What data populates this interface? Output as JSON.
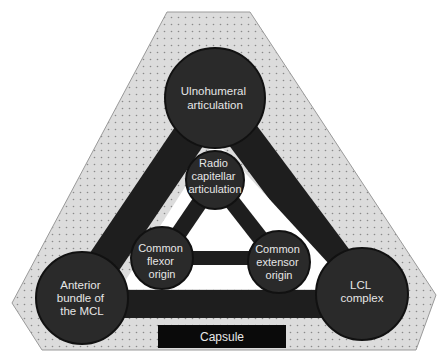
{
  "diagram": {
    "colors": {
      "background": "#ffffff",
      "capsule_fill": "#dcdcdc",
      "capsule_dot": "#8a8a8a",
      "capsule_border": "#9a9a9a",
      "band": "#1e1e1e",
      "node": "#2a2a2a",
      "node_border": "#111111",
      "label_text": "#e6e6e6",
      "capsule_box": "#0a0a0a"
    },
    "nodes": {
      "ulnohumeral": {
        "lines": [
          "Ulnohumeral",
          "articulation"
        ]
      },
      "radiocapitellar": {
        "lines": [
          "Radio",
          "capitellar",
          "articulation"
        ]
      },
      "common_flexor": {
        "lines": [
          "Common",
          "flexor",
          "origin"
        ]
      },
      "common_extensor": {
        "lines": [
          "Common",
          "extensor",
          "origin"
        ]
      },
      "anterior_mcl": {
        "lines": [
          "Anterior",
          "bundle of",
          "the MCL"
        ]
      },
      "lcl_complex": {
        "lines": [
          "LCL",
          "complex"
        ]
      }
    },
    "capsule": {
      "label": "Capsule"
    }
  }
}
